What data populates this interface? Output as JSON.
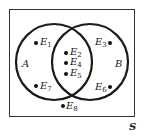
{
  "diagram": {
    "type": "venn",
    "universe_label": "S",
    "sets": [
      {
        "name": "A"
      },
      {
        "name": "B"
      }
    ],
    "elements": [
      {
        "id": "E1",
        "letter": "E",
        "sub": "1",
        "region": "A only"
      },
      {
        "id": "E2",
        "letter": "E",
        "sub": "2",
        "region": "A and B"
      },
      {
        "id": "E3",
        "letter": "E",
        "sub": "3",
        "region": "B only"
      },
      {
        "id": "E4",
        "letter": "E",
        "sub": "4",
        "region": "A and B"
      },
      {
        "id": "E5",
        "letter": "E",
        "sub": "5",
        "region": "A and B"
      },
      {
        "id": "E6",
        "letter": "E",
        "sub": "6",
        "region": "B only"
      },
      {
        "id": "E7",
        "letter": "E",
        "sub": "7",
        "region": "A only"
      },
      {
        "id": "E8",
        "letter": "E",
        "sub": "8",
        "region": "neither"
      }
    ],
    "colors": {
      "stroke": "#1a1a1a",
      "background": "#ffffff"
    }
  }
}
